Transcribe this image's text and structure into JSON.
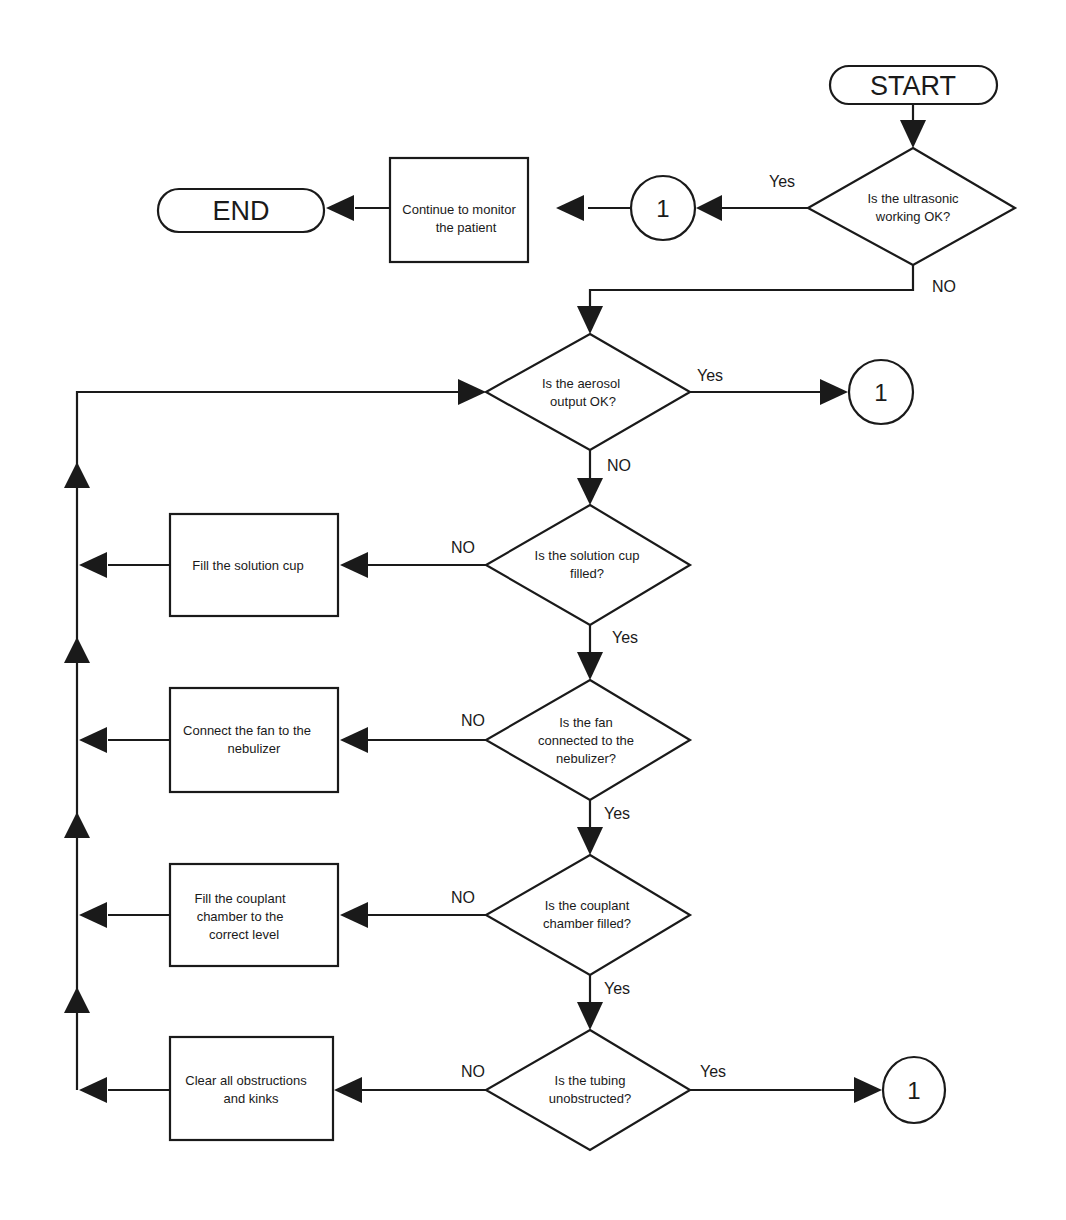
{
  "diagram": {
    "type": "flowchart",
    "terminals": {
      "start": "START",
      "end": "END"
    },
    "decisions": [
      {
        "id": "d1",
        "lines": [
          "Is the ultrasonic",
          "working OK?"
        ],
        "yes": "Yes",
        "no": "NO"
      },
      {
        "id": "d2",
        "lines": [
          "Is the aerosol",
          "output OK?"
        ],
        "yes": "Yes",
        "no": "NO"
      },
      {
        "id": "d3",
        "lines": [
          "Is the solution cup",
          "filled?"
        ],
        "yes": "Yes",
        "no": "NO"
      },
      {
        "id": "d4",
        "lines": [
          "Is the fan",
          "connected to the",
          "nebulizer?"
        ],
        "yes": "Yes",
        "no": "NO"
      },
      {
        "id": "d5",
        "lines": [
          "Is the couplant",
          "chamber filled?"
        ],
        "yes": "Yes",
        "no": "NO"
      },
      {
        "id": "d6",
        "lines": [
          "Is the tubing",
          "unobstructed?"
        ],
        "yes": "Yes",
        "no": "NO"
      }
    ],
    "processes": [
      {
        "id": "p0",
        "lines": [
          "Continue to monitor",
          "the patient"
        ]
      },
      {
        "id": "p1",
        "lines": [
          "Fill the solution cup"
        ]
      },
      {
        "id": "p2",
        "lines": [
          "Connect the fan to the",
          "nebulizer"
        ]
      },
      {
        "id": "p3",
        "lines": [
          "Fill the couplant",
          "chamber to the",
          "correct level"
        ]
      },
      {
        "id": "p4",
        "lines": [
          "Clear all obstructions",
          "and kinks"
        ]
      }
    ],
    "connectors": [
      {
        "id": "c_top",
        "label": "1"
      },
      {
        "id": "c_mid",
        "label": "1"
      },
      {
        "id": "c_bot",
        "label": "1"
      }
    ]
  }
}
